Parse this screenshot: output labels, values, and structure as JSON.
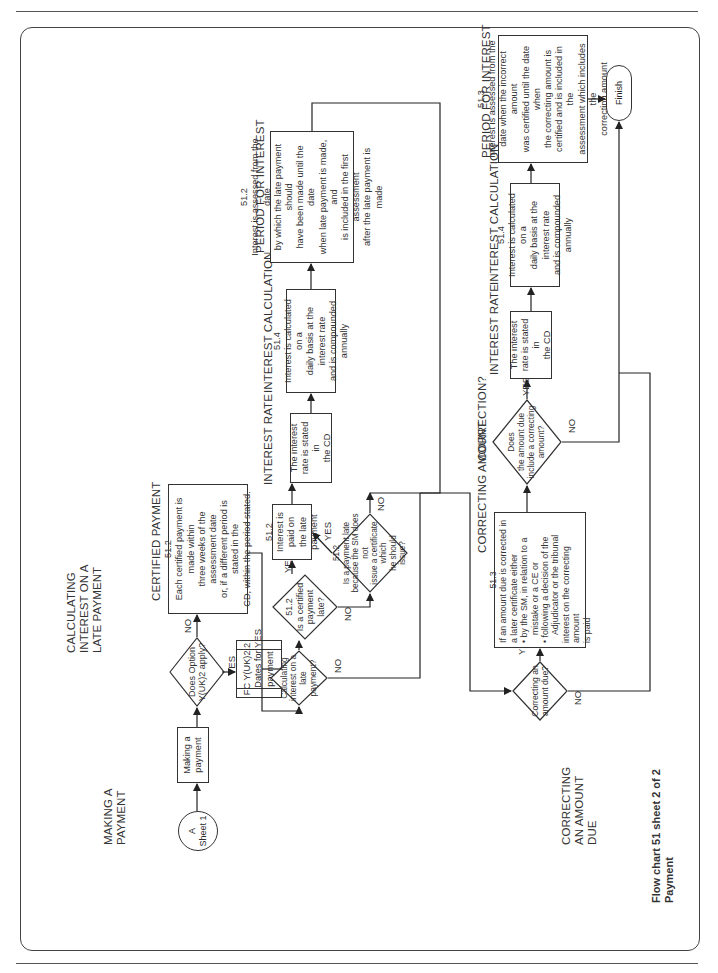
{
  "document": {
    "orientation": "rotated-90-ccw",
    "footer": {
      "title": "Flow chart 51 sheet 2 of 2",
      "subtitle": "Payment"
    }
  },
  "sections": {
    "making_payment": "MAKING A\nPAYMENT",
    "calculating_interest": "CALCULATING\nINTEREST ON A\nLATE PAYMENT",
    "correcting_amount_due": "CORRECTING\nAN AMOUNT\nDUE"
  },
  "headings": {
    "certified_payment": "CERTIFIED PAYMENT",
    "interest_rate_1": "INTEREST RATE",
    "interest_calculation_1": "INTEREST CALCULATION",
    "period_for_interest_1": "PERIOD FOR INTEREST",
    "correcting_amount": "CORRECTING AMOUNT",
    "correction": "CORRECTION?",
    "interest_rate_2": "INTEREST RATE",
    "interest_calculation_2": "INTEREST CALCULATION",
    "period_for_interest_2": "PERIOD FOR INTEREST"
  },
  "nodes": {
    "connector_a": "A\nSheet 1",
    "making_a_payment": "Making a\npayment",
    "does_option_apply": "Does Option\nY(UK)2 apply?",
    "fc_dates_for_payment": "FC Y(UK)2.2\nDates for payment",
    "certified_payment_box": "51.2\nEach certified payment is made within\nthree weeks of the assessment date\nor, if a different period is stated in the\nCD, within the period stated.",
    "calculating_interest_q": "Calculating\ninterest on a late\npayment?",
    "is_certified_payment_late": "51.2\nIs a certified payment\nlate?",
    "interest_paid_on_late": "51.2\nInterest is paid on\nthe late payment",
    "is_payment_late_sm": "51.2\nIs a payment late\nbecause the SM does not\nissue a certificate which\nhe should\nissue?",
    "interest_rate_box_1": "The interest\nrate is stated in\nthe CD",
    "interest_calc_box_1": "51.4\nInterest is calculated on a\ndaily basis at the interest rate\nand is compounded annually",
    "period_box_1": "51.2\nInterest is assessed from the date\nby which the late payment should\nhave been made until the date\nwhen late payment is made, and\nis included in the first assessment\nafter the late payment is made",
    "correcting_amount_due_q": "Correcting an\namount due?",
    "correcting_amount_box": {
      "ref": "51.3",
      "intro": "If an amount due is corrected in\na later certificate either",
      "bullets": [
        "by the SM, in relation to a\nmistake or a CE or",
        "following a decision of the\nAdjudicator or the tribunal"
      ],
      "outro": "interest on the correcting amount\nis paid"
    },
    "does_amount_include_correcting": "Does\nthe amount due\ninclude a correcting\namount?",
    "interest_rate_box_2": "The interest\nrate is stated in\nthe CD",
    "interest_calc_box_2": "51.4\nInterest is calculated on a\ndaily basis at the interest rate\nand is compounded annually",
    "period_box_2": "51.3\nInterest is assessed from the\ndate when the incorrect amount\nwas certified until the date when\nthe correcting amount is\ncertified and is included in the\nassessment which includes the\ncorrecting amount",
    "finish": "Finish"
  },
  "edge_labels": {
    "yes": "YES",
    "no": "NO"
  }
}
